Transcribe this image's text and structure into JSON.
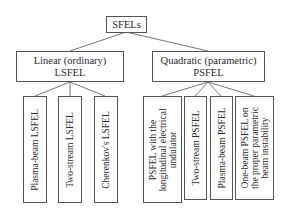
{
  "root": {
    "label": "SFELs"
  },
  "branches": [
    {
      "label_line1": "Linear (ordinary)",
      "label_line2": "LSFEL",
      "leaves": [
        {
          "label": "Plasma-beam LSFEL"
        },
        {
          "label": "Two-stream LSFEL"
        },
        {
          "label": "Cherenkov's LSFEL"
        }
      ]
    },
    {
      "label_line1": "Quadratic (parametric)",
      "label_line2": "PSFEL",
      "leaves": [
        {
          "line1": "PSFEL with the",
          "line2": "longitudinal electrical",
          "line3": "undulator"
        },
        {
          "label": "Two-stream PSFEL"
        },
        {
          "label": "Plasma-beam PSFEL"
        },
        {
          "line1": "One-beam PSFEL on",
          "line2": "the proper parametric",
          "line3": "beam instability"
        }
      ]
    }
  ]
}
